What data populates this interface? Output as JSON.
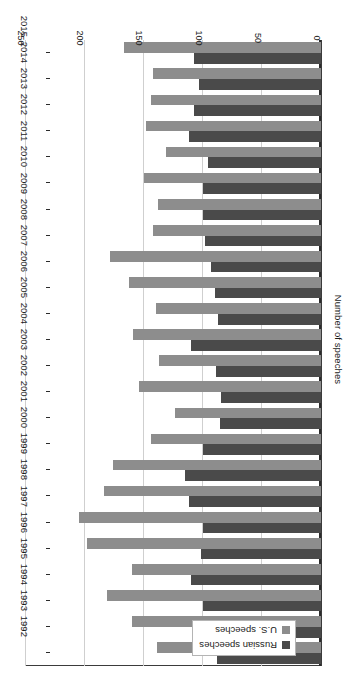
{
  "chart_data": {
    "type": "bar",
    "orientation": "horizontal",
    "title": "",
    "xlabel": "",
    "ylabel": "Number of speeches",
    "value_axis_label": "Number of speeches",
    "categories": [
      "1992",
      "1993",
      "1994",
      "1995",
      "1996",
      "1997",
      "1998",
      "1999",
      "2000",
      "2001",
      "2002",
      "2003",
      "2004",
      "2005",
      "2006",
      "2007",
      "2008",
      "2009",
      "2010",
      "2011",
      "2012",
      "2013",
      "2014",
      "2015"
    ],
    "tick_labels": [
      "0",
      "50",
      "100",
      "150",
      "200",
      "250"
    ],
    "ticks": [
      0,
      50,
      100,
      150,
      200,
      250
    ],
    "ylim": [
      0,
      250
    ],
    "grid": true,
    "legend_position": "top-left",
    "series": [
      {
        "name": "Russian speeches",
        "color": "#4a4a4a",
        "values": [
          88,
          90,
          100,
          110,
          102,
          100,
          112,
          115,
          100,
          86,
          85,
          89,
          110,
          87,
          90,
          93,
          98,
          100,
          100,
          96,
          112,
          108,
          103,
          108
        ]
      },
      {
        "name": "U.S. speeches",
        "color": "#8d8d8d",
        "values": [
          139,
          160,
          181,
          160,
          198,
          205,
          184,
          176,
          144,
          124,
          154,
          137,
          159,
          140,
          163,
          179,
          142,
          138,
          150,
          131,
          148,
          144,
          142,
          167
        ]
      }
    ]
  },
  "legend": {
    "items": [
      {
        "label": "Russian speeches",
        "color": "#4a4a4a"
      },
      {
        "label": "U.S. speeches",
        "color": "#8d8d8d"
      }
    ]
  },
  "axes": {
    "value_axis_title": "Number of speeches",
    "value_ticks": [
      "0",
      "50",
      "100",
      "150",
      "200",
      "250"
    ],
    "category_ticks": [
      "1992",
      "1993",
      "1994",
      "1995",
      "1996",
      "1997",
      "1998",
      "1999",
      "2000",
      "2001",
      "2002",
      "2003",
      "2004",
      "2005",
      "2006",
      "2007",
      "2008",
      "2009",
      "2010",
      "2011",
      "2012",
      "2013",
      "2014",
      "2015"
    ]
  },
  "caption": {
    "text": ""
  }
}
